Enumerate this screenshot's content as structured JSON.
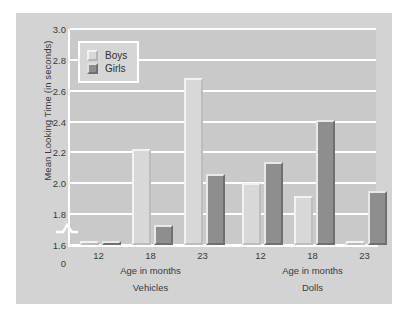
{
  "chart_data": {
    "type": "bar",
    "title": "",
    "subtitle": "",
    "xlabel": "Age in months",
    "ylabel": "Mean Looking Time (in seconds)",
    "ylim": [
      1.6,
      3.0
    ],
    "y_axis_break": true,
    "y_baseline_label": "0",
    "yticks": [
      "3.0",
      "2.8",
      "2.6",
      "2.4",
      "2.2",
      "2.0",
      "1.8",
      "1.6",
      "0"
    ],
    "ytick_values": [
      3.0,
      2.8,
      2.6,
      2.4,
      2.2,
      2.0,
      1.8,
      1.6,
      0
    ],
    "grid": true,
    "legend_position": "upper-left-inside",
    "categories": [
      "12",
      "18",
      "23"
    ],
    "panels": [
      {
        "name": "Vehicles",
        "xlabel": "Age in months",
        "categories": [
          "12",
          "18",
          "23"
        ],
        "series": [
          {
            "name": "Boys",
            "values": [
              1.38,
              2.22,
              2.68
            ]
          },
          {
            "name": "Girls",
            "values": [
              1.52,
              1.73,
              2.06
            ]
          }
        ]
      },
      {
        "name": "Dolls",
        "xlabel": "Age in months",
        "categories": [
          "12",
          "18",
          "23"
        ],
        "series": [
          {
            "name": "Boys",
            "values": [
              2.0,
              1.92,
              1.6
            ]
          },
          {
            "name": "Girls",
            "values": [
              2.14,
              2.41,
              1.95
            ]
          }
        ]
      }
    ],
    "legend": [
      {
        "name": "Boys",
        "color": "#d8d8d8"
      },
      {
        "name": "Girls",
        "color": "#8e8e8e"
      }
    ],
    "colors": {
      "figure_background": "#d3d3d3",
      "plot_background": "#c9c9c9",
      "gridline": "#ffffff",
      "boys_bar": "#d8d8d8",
      "girls_bar": "#8e8e8e",
      "text": "#3a3a3a"
    }
  }
}
